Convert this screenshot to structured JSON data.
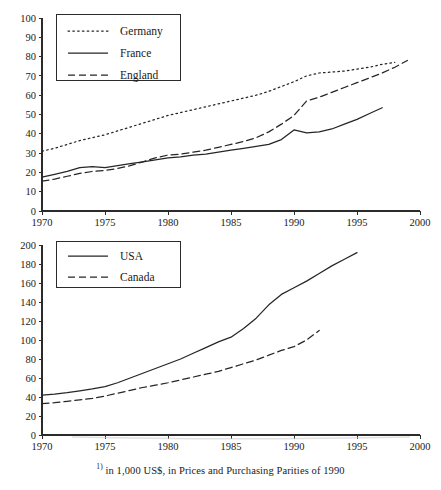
{
  "footnote": {
    "marker": "1)",
    "text": " in 1,000 US$, in Prices and Purchasing Parities of 1990"
  },
  "chart_data": [
    {
      "type": "line",
      "title": "",
      "xlabel": "",
      "ylabel": "",
      "xlim": [
        1970,
        2000
      ],
      "ylim": [
        0,
        100
      ],
      "xticks": [
        1970,
        1975,
        1980,
        1985,
        1990,
        1995,
        2000
      ],
      "yticks": [
        0,
        10,
        20,
        30,
        40,
        50,
        60,
        70,
        80,
        90,
        100
      ],
      "grid": false,
      "legend_position": "top-left",
      "series": [
        {
          "name": "Germany",
          "style": "dotted",
          "x": [
            1970,
            1971,
            1972,
            1973,
            1974,
            1975,
            1976,
            1977,
            1978,
            1979,
            1980,
            1981,
            1982,
            1983,
            1984,
            1985,
            1986,
            1987,
            1988,
            1989,
            1990,
            1991,
            1992,
            1993,
            1994,
            1995,
            1996,
            1997,
            1998
          ],
          "values": [
            31,
            32.5,
            34.5,
            36.5,
            38,
            39.5,
            41.5,
            43.5,
            45.5,
            47.5,
            49.5,
            51,
            52.5,
            54,
            55.5,
            57,
            58.5,
            60,
            62,
            64.5,
            67,
            70,
            71.5,
            72,
            72.5,
            73.5,
            74.5,
            76,
            77
          ]
        },
        {
          "name": "France",
          "style": "solid",
          "x": [
            1970,
            1971,
            1972,
            1973,
            1974,
            1975,
            1976,
            1977,
            1978,
            1979,
            1980,
            1981,
            1982,
            1983,
            1984,
            1985,
            1986,
            1987,
            1988,
            1989,
            1990,
            1991,
            1992,
            1993,
            1994,
            1995,
            1996,
            1997
          ],
          "values": [
            17.5,
            19,
            20.5,
            22.5,
            23,
            22.5,
            23.5,
            24.5,
            25.5,
            26.5,
            27.5,
            28,
            29,
            29.5,
            30.5,
            31.5,
            32.5,
            33.5,
            34.5,
            37,
            42,
            40.5,
            41,
            42.5,
            45,
            47.5,
            50.5,
            53.5
          ]
        },
        {
          "name": "England",
          "style": "dashed",
          "x": [
            1970,
            1971,
            1972,
            1973,
            1974,
            1975,
            1976,
            1977,
            1978,
            1979,
            1980,
            1981,
            1982,
            1983,
            1984,
            1985,
            1986,
            1987,
            1988,
            1989,
            1990,
            1991,
            1992,
            1993,
            1994,
            1995,
            1996,
            1997,
            1998,
            1999
          ],
          "values": [
            15.5,
            16.5,
            18,
            19.5,
            20.5,
            21,
            22,
            23.5,
            25.5,
            27.5,
            29,
            29.5,
            30.5,
            31.5,
            33,
            34.5,
            36,
            38,
            41,
            45,
            49.5,
            57,
            59,
            61.5,
            64,
            66.5,
            69,
            71.5,
            74.5,
            78
          ]
        }
      ]
    },
    {
      "type": "line",
      "title": "",
      "xlabel": "",
      "ylabel": "",
      "xlim": [
        1970,
        2000
      ],
      "ylim": [
        0,
        200
      ],
      "xticks": [
        1970,
        1975,
        1980,
        1985,
        1990,
        1995,
        2000
      ],
      "yticks": [
        0,
        20,
        40,
        60,
        80,
        100,
        120,
        140,
        160,
        180,
        200
      ],
      "grid": false,
      "legend_position": "top-left",
      "series": [
        {
          "name": "USA",
          "style": "solid",
          "x": [
            1970,
            1971,
            1972,
            1973,
            1974,
            1975,
            1976,
            1977,
            1978,
            1979,
            1980,
            1981,
            1982,
            1983,
            1984,
            1985,
            1986,
            1987,
            1988,
            1989,
            1990,
            1991,
            1992,
            1993,
            1994,
            1995
          ],
          "values": [
            42,
            43,
            44.5,
            46.5,
            48.5,
            51,
            55,
            60,
            65,
            70,
            75,
            80,
            86,
            92,
            98,
            103,
            112,
            123,
            137,
            148,
            155,
            162,
            170,
            178,
            185,
            192
          ]
        },
        {
          "name": "Canada",
          "style": "dashed",
          "x": [
            1970,
            1971,
            1972,
            1973,
            1974,
            1975,
            1976,
            1977,
            1978,
            1979,
            1980,
            1981,
            1982,
            1983,
            1984,
            1985,
            1986,
            1987,
            1988,
            1989,
            1990,
            1991,
            1992
          ],
          "values": [
            33,
            34,
            35.5,
            37,
            38.5,
            41,
            44,
            47,
            50,
            52.5,
            55,
            58,
            61,
            64,
            67,
            71,
            75,
            79,
            84,
            89,
            93,
            100,
            110
          ]
        }
      ]
    }
  ]
}
